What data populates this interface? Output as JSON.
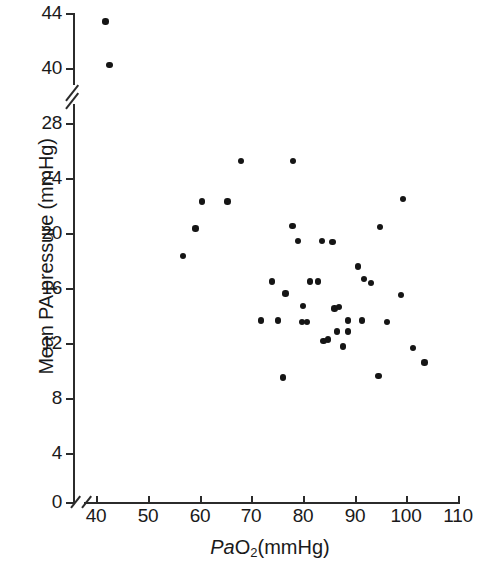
{
  "chart_data": {
    "type": "scatter",
    "title": "",
    "xlabel": "PaO2(mmHg)",
    "ylabel": "Mean PA pressure (mmHg)",
    "xlabel_parts": {
      "italic": "Pa",
      "sub_base": "O",
      "sub": "2",
      "rest": "(mmHg)"
    },
    "xlim": [
      40,
      110
    ],
    "ylim": [
      0,
      44
    ],
    "xticks": [
      40,
      50,
      60,
      70,
      80,
      90,
      100,
      110
    ],
    "yticks": [
      0,
      4,
      8,
      12,
      16,
      20,
      24,
      28,
      40,
      44
    ],
    "y_axis_break": {
      "between": [
        28,
        40
      ],
      "present": true
    },
    "x_axis_break": {
      "before": 40,
      "present": true
    },
    "grid": false,
    "legend": null,
    "marker": {
      "shape": "circle",
      "color": "#151515",
      "size": 6
    },
    "n_points": 41,
    "points": [
      {
        "x": 41.8,
        "y": 43.4
      },
      {
        "x": 42.6,
        "y": 40.2
      },
      {
        "x": 68.0,
        "y": 25.2
      },
      {
        "x": 78.1,
        "y": 25.2
      },
      {
        "x": 60.5,
        "y": 22.2
      },
      {
        "x": 65.4,
        "y": 22.2
      },
      {
        "x": 99.4,
        "y": 22.4
      },
      {
        "x": 59.2,
        "y": 20.2
      },
      {
        "x": 78.0,
        "y": 20.4
      },
      {
        "x": 94.9,
        "y": 20.3
      },
      {
        "x": 79.1,
        "y": 19.3
      },
      {
        "x": 83.7,
        "y": 19.3
      },
      {
        "x": 85.7,
        "y": 19.2
      },
      {
        "x": 56.8,
        "y": 18.2
      },
      {
        "x": 90.7,
        "y": 17.4
      },
      {
        "x": 81.4,
        "y": 16.3
      },
      {
        "x": 82.9,
        "y": 16.3
      },
      {
        "x": 91.8,
        "y": 16.5
      },
      {
        "x": 76.6,
        "y": 15.4
      },
      {
        "x": 99.0,
        "y": 15.3
      },
      {
        "x": 87.0,
        "y": 14.4
      },
      {
        "x": 86.1,
        "y": 14.3
      },
      {
        "x": 80.0,
        "y": 14.5
      },
      {
        "x": 71.9,
        "y": 13.4
      },
      {
        "x": 75.2,
        "y": 13.4
      },
      {
        "x": 79.8,
        "y": 13.3
      },
      {
        "x": 80.8,
        "y": 13.3
      },
      {
        "x": 88.7,
        "y": 13.4
      },
      {
        "x": 91.4,
        "y": 13.4
      },
      {
        "x": 96.3,
        "y": 13.3
      },
      {
        "x": 86.6,
        "y": 12.6
      },
      {
        "x": 88.7,
        "y": 12.6
      },
      {
        "x": 84.8,
        "y": 12.0
      },
      {
        "x": 87.8,
        "y": 11.5
      },
      {
        "x": 101.3,
        "y": 11.4
      },
      {
        "x": 103.5,
        "y": 10.3
      },
      {
        "x": 76.2,
        "y": 9.2
      },
      {
        "x": 94.6,
        "y": 9.3
      },
      {
        "x": 84.0,
        "y": 11.9
      },
      {
        "x": 93.2,
        "y": 16.2
      },
      {
        "x": 74.0,
        "y": 16.3
      }
    ]
  },
  "axis": {
    "y_tick_labels": [
      "44",
      "40",
      "28",
      "24",
      "20",
      "16",
      "12",
      "8",
      "4",
      "0"
    ],
    "x_tick_labels": [
      "40",
      "50",
      "60",
      "70",
      "80",
      "90",
      "100",
      "110"
    ]
  }
}
